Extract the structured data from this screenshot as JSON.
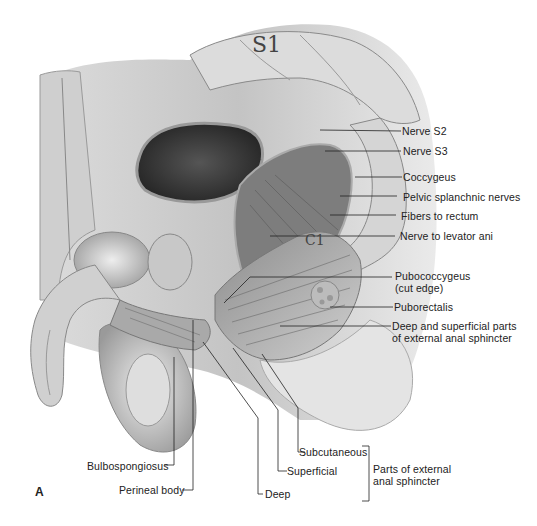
{
  "figure": {
    "panel_letter": "A",
    "bone_labels": {
      "s1": "S1",
      "c1": "C1"
    }
  },
  "labels_right": [
    {
      "id": "nerve-s2",
      "text": "Nerve S2"
    },
    {
      "id": "nerve-s3",
      "text": "Nerve S3"
    },
    {
      "id": "coccygeus",
      "text": "Coccygeus"
    },
    {
      "id": "pelvic-splanchnic-nerves",
      "text": "Pelvic splanchnic nerves"
    },
    {
      "id": "fibers-to-rectum",
      "text": "Fibers to rectum"
    },
    {
      "id": "nerve-to-levator-ani",
      "text": "Nerve to levator ani"
    },
    {
      "id": "pubococcygeus",
      "text": "Pubococcygeus",
      "text2": "(cut edge)"
    },
    {
      "id": "puborectalis",
      "text": "Puborectalis"
    },
    {
      "id": "deep-superficial-parts",
      "text": "Deep and superficial parts",
      "text2": "of external anal sphincter"
    }
  ],
  "labels_bottom": [
    {
      "id": "bulbospongiosus",
      "text": "Bulbospongiosus"
    },
    {
      "id": "perineal-body",
      "text": "Perineal body"
    },
    {
      "id": "deep",
      "text": "Deep"
    },
    {
      "id": "superficial",
      "text": "Superficial"
    },
    {
      "id": "subcutaneous",
      "text": "Subcutaneous"
    }
  ],
  "bracket_label": {
    "line1": "Parts of external",
    "line2": "anal sphincter"
  }
}
